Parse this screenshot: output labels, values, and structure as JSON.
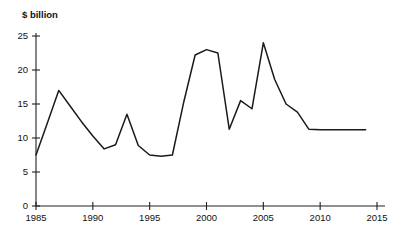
{
  "chart_data": {
    "type": "line",
    "title": "",
    "subtitle": "",
    "ylabel": "$ billion",
    "xlabel": "",
    "xlim": [
      1985,
      2015
    ],
    "ylim": [
      0,
      25
    ],
    "grid": false,
    "legend": null,
    "yticks": [
      0,
      5,
      10,
      15,
      20,
      25
    ],
    "ytick_labels": [
      "0",
      "5",
      "10",
      "15",
      "20",
      "25"
    ],
    "xticks": [
      1985,
      1990,
      1995,
      2000,
      2005,
      2010,
      2015
    ],
    "xtick_labels": [
      "1985",
      "1990",
      "1995",
      "2000",
      "2005",
      "2010",
      "2015"
    ],
    "series": [
      {
        "name": "",
        "color": "#1a1a1a",
        "x": [
          1985,
          1986,
          1987,
          1988,
          1989,
          1990,
          1991,
          1992,
          1993,
          1994,
          1995,
          1996,
          1997,
          1998,
          1999,
          2000,
          2001,
          2002,
          2003,
          2004,
          2005,
          2006,
          2007,
          2008,
          2009,
          2010,
          2011,
          2012,
          2013,
          2014
        ],
        "values": [
          7.5,
          12.2,
          17.0,
          14.7,
          12.4,
          10.3,
          8.4,
          9.0,
          13.5,
          8.9,
          7.5,
          7.3,
          7.5,
          15.3,
          22.2,
          23.0,
          22.5,
          11.3,
          15.5,
          14.3,
          24.0,
          18.6,
          15.0,
          13.8,
          11.3,
          11.2,
          11.2,
          11.2,
          11.2,
          11.2
        ]
      }
    ]
  },
  "axis_title": {
    "text": "$ billion"
  },
  "colors": {
    "line": "#1a1a1a",
    "axis": "#231f20",
    "background": "#ffffff"
  }
}
